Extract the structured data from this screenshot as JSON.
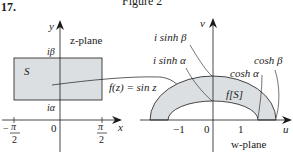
{
  "header": {
    "problem_number": "17.",
    "figure_caption": "Figure 2"
  },
  "z_plane": {
    "plane_label": "z-plane",
    "y_axis_label": "y",
    "x_axis_label": "x",
    "region_label": "S",
    "top_label": "iβ",
    "bottom_label": "iα",
    "origin_label": "0",
    "left_tick": {
      "sign": "−",
      "numerator": "π",
      "denominator": "2"
    },
    "right_tick": {
      "numerator": "π",
      "denominator": "2"
    }
  },
  "mapping": {
    "label": "f(z) = sin z"
  },
  "w_plane": {
    "plane_label": "w-plane",
    "v_axis_label": "v",
    "u_axis_label": "u",
    "region_label": "f[S]",
    "labels": {
      "i_sinh_beta": "i sinh β",
      "i_sinh_alpha": "i sinh α",
      "cosh_alpha": "cosh α",
      "cosh_beta": "cosh β"
    },
    "ticks": [
      "−1",
      "0",
      "1"
    ]
  },
  "colors": {
    "region_fill": "#dcdfe2",
    "stroke": "#1a1a1a"
  }
}
